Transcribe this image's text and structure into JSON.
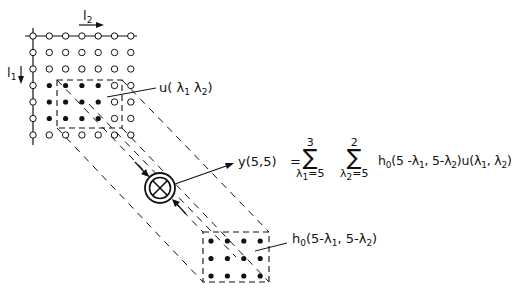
{
  "diagram": {
    "axis_labels": {
      "l2": {
        "base": "l",
        "sub": "2"
      },
      "l1": {
        "base": "l",
        "sub": "1"
      }
    },
    "input_grid": {
      "cols": 7,
      "rows": 7,
      "filled_region": {
        "row_start": 3,
        "row_end": 5,
        "col_start": 1,
        "col_end": 4
      }
    },
    "input_label": {
      "func": "u",
      "open": "(",
      "l1": "λ",
      "s1": "1",
      "l2": "λ",
      "s2": "2",
      "close": ")"
    },
    "output_label": "y(5,5)",
    "equation": {
      "lhs": "y(5,5)",
      "eq": "=",
      "sum1": {
        "upper": "3",
        "lower_var": "λ",
        "lower_sub": "1",
        "lower_val": "=5"
      },
      "sum2": {
        "upper": "2",
        "lower_var": "λ",
        "lower_sub": "2",
        "lower_val": "=5"
      },
      "term_h": "h",
      "term_h_sub": "0",
      "term_rest_a": "(5 -λ",
      "term_rest_a_sub": "1",
      "term_rest_b": ", 5-λ",
      "term_rest_b_sub": "2",
      "term_rest_c": ")u(λ",
      "term_rest_c_sub": "1",
      "term_rest_d": ", λ",
      "term_rest_d_sub": "2",
      "term_rest_e": ")"
    },
    "kernel_label": {
      "h": "h",
      "h_sub": "0",
      "a": "(5-λ",
      "a_sub": "1",
      "b": ", 5-λ",
      "b_sub": "2",
      "c": ")"
    },
    "operator_symbol": "multiply-sum (⊗)",
    "kernel_grid": {
      "cols": 4,
      "rows": 3
    }
  }
}
